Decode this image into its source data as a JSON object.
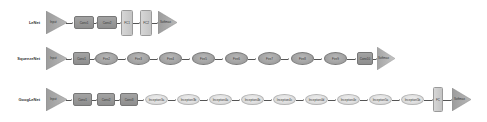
{
  "rows": [
    {
      "label": "LeNet",
      "nodes": [
        {
          "type": "triangle",
          "label": "Input"
        },
        {
          "type": "conv",
          "label": "Conv1"
        },
        {
          "type": "conv",
          "label": "Conv2"
        },
        {
          "type": "fc",
          "label": "FC1"
        },
        {
          "type": "fc",
          "label": "FC2"
        },
        {
          "type": "triangle",
          "label": "Softmax"
        }
      ]
    },
    {
      "label": "SqueezeNet",
      "nodes": [
        {
          "type": "triangle",
          "label": "Input"
        },
        {
          "type": "conv",
          "label": "Conv1"
        },
        {
          "type": "ellipse-dark",
          "label": "Fire2"
        },
        {
          "type": "ellipse-dark",
          "label": "Fire3"
        },
        {
          "type": "ellipse-dark",
          "label": "Fire4"
        },
        {
          "type": "ellipse-dark",
          "label": "Fire5"
        },
        {
          "type": "ellipse-dark",
          "label": "Fire6"
        },
        {
          "type": "ellipse-dark",
          "label": "Fire7"
        },
        {
          "type": "ellipse-dark",
          "label": "Fire8"
        },
        {
          "type": "ellipse-dark",
          "label": "Fire9"
        },
        {
          "type": "conv",
          "label": "Conv10"
        },
        {
          "type": "triangle",
          "label": "Softmax"
        }
      ]
    },
    {
      "label": "GoogLeNet",
      "nodes": [
        {
          "type": "triangle",
          "label": "Input"
        },
        {
          "type": "conv",
          "label": "Conv1"
        },
        {
          "type": "conv",
          "label": "Conv2"
        },
        {
          "type": "conv",
          "label": "Conv3"
        },
        {
          "type": "ellipse-light",
          "label": "Inception3a"
        },
        {
          "type": "ellipse-light",
          "label": "Inception3b"
        },
        {
          "type": "ellipse-light",
          "label": "Inception4a"
        },
        {
          "type": "ellipse-light",
          "label": "Inception4b"
        },
        {
          "type": "ellipse-light",
          "label": "Inception4c"
        },
        {
          "type": "ellipse-light",
          "label": "Inception4d"
        },
        {
          "type": "ellipse-light",
          "label": "Inception4e"
        },
        {
          "type": "ellipse-light",
          "label": "Inception5a"
        },
        {
          "type": "ellipse-light",
          "label": "Inception5b"
        },
        {
          "type": "fc",
          "label": "FC"
        },
        {
          "type": "triangle",
          "label": "Softmax"
        }
      ]
    }
  ],
  "colors": {
    "conv": "#999999",
    "fc": "#cccccc",
    "ellipse_dark": "#a6a6a6",
    "ellipse_light": "#dedede",
    "triangle": "#a5a5a5",
    "arrow": "#555555"
  }
}
